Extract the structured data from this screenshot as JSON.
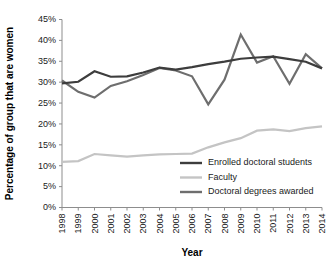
{
  "chart_data": {
    "type": "line",
    "title": "",
    "xlabel": "Year",
    "ylabel": "Percentage of group that are women",
    "categories": [
      1998,
      1999,
      2000,
      2001,
      2002,
      2003,
      2004,
      2005,
      2006,
      2007,
      2008,
      2009,
      2010,
      2011,
      2012,
      2013,
      2014
    ],
    "x_tick_labels": [
      "1998",
      "1999",
      "2000",
      "2001",
      "2002",
      "2003",
      "2004",
      "2005",
      "2006",
      "2007",
      "2008",
      "2009",
      "2010",
      "2011",
      "2012",
      "2013",
      "2014"
    ],
    "y_tick_labels": [
      "0%",
      "5%",
      "10%",
      "15%",
      "20%",
      "25%",
      "30%",
      "35%",
      "40%",
      "45%"
    ],
    "y_tick_values": [
      0,
      5,
      10,
      15,
      20,
      25,
      30,
      35,
      40,
      45
    ],
    "ylim": [
      0,
      45
    ],
    "xlim": [
      1998,
      2014
    ],
    "grid": false,
    "legend_position": "inside-lower-right",
    "series": [
      {
        "name": "Enrolled doctoral students",
        "color": "#3d3d3d",
        "width": 2.2,
        "values": [
          29.7,
          30.1,
          32.6,
          31.3,
          31.4,
          32.3,
          33.5,
          33.0,
          33.6,
          34.3,
          34.9,
          35.6,
          35.9,
          36.1,
          35.5,
          34.9,
          33.3
        ]
      },
      {
        "name": "Faculty",
        "color": "#c4c4c4",
        "width": 2.2,
        "values": [
          10.9,
          11.1,
          12.8,
          12.5,
          12.2,
          12.5,
          12.7,
          12.8,
          12.9,
          14.4,
          15.6,
          16.6,
          18.4,
          18.7,
          18.3,
          19.0,
          19.4
        ]
      },
      {
        "name": "Doctoral degrees awarded",
        "color": "#6e6e6e",
        "width": 2.2,
        "values": [
          30.4,
          27.7,
          26.3,
          29.1,
          30.2,
          31.7,
          33.4,
          32.8,
          31.4,
          24.7,
          30.6,
          41.4,
          34.7,
          36.2,
          29.6,
          36.7,
          33.3
        ]
      }
    ]
  },
  "legend": {
    "items": [
      {
        "label": "Enrolled doctoral students",
        "color": "#3d3d3d"
      },
      {
        "label": "Faculty",
        "color": "#c4c4c4"
      },
      {
        "label": "Doctoral degrees awarded",
        "color": "#6e6e6e"
      }
    ]
  }
}
